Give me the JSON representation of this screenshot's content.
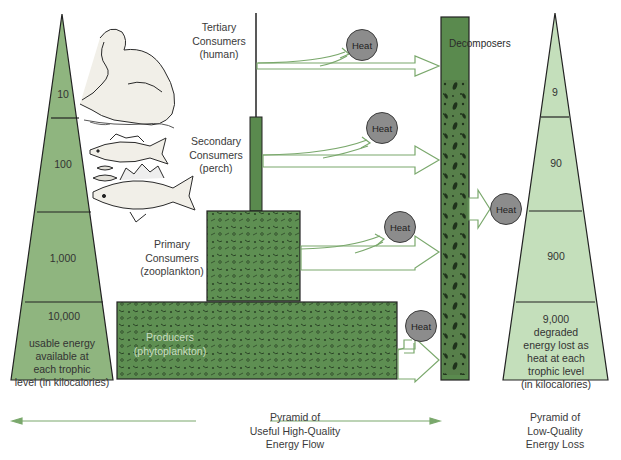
{
  "left_pyramid": {
    "title": "Pyramid of Useful High-Quality Energy Flow",
    "title_lines": [
      "Pyramid of",
      "Useful High-Quality",
      "Energy Flow"
    ],
    "levels": [
      {
        "value": "10"
      },
      {
        "value": "100"
      },
      {
        "value": "1,000"
      },
      {
        "value": "10,000"
      }
    ],
    "note_lines": [
      "usable energy",
      "available at",
      "each trophic",
      "level  (in kilocalories)"
    ]
  },
  "right_pyramid": {
    "title_lines": [
      "Pyramid of",
      "Low-Quality",
      "Energy Loss"
    ],
    "levels": [
      {
        "value": "9"
      },
      {
        "value": "90"
      },
      {
        "value": "900"
      },
      {
        "value": "9,000"
      }
    ],
    "note_lines": [
      "degraded",
      "energy lost as",
      "heat at each",
      "trophic level",
      "(in kilocalories)"
    ]
  },
  "trophic_levels": {
    "tertiary": [
      "Tertiary",
      "Consumers",
      "(human)"
    ],
    "secondary": [
      "Secondary",
      "Consumers",
      "(perch)"
    ],
    "primary": [
      "Primary",
      "Consumers",
      "(zooplankton)"
    ],
    "producers": [
      "Producers",
      "(phytoplankton)"
    ]
  },
  "decomposers": {
    "label": "Decomposers"
  },
  "heat": {
    "label": "Heat"
  },
  "colors": {
    "pyramid_green": "#8fb57f",
    "pyramid_light": "#c4dfbb",
    "block_green": "#5a8a4e",
    "arrow_green": "#7aa86c",
    "heat_gray": "#8c8c8c"
  }
}
